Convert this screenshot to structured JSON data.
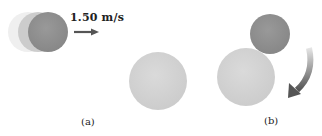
{
  "diagram": {
    "panels": [
      {
        "id": "a",
        "caption": "(a)",
        "velocity_label": "1.50 m/s",
        "description": "Small dark sphere moving right toward large light sphere at rest"
      },
      {
        "id": "b",
        "caption": "(b)",
        "description": "Small dark sphere in contact with large sphere; curved arrow indicating rotation/deflection"
      }
    ],
    "colors": {
      "small_sphere": "#8f8f8f",
      "large_sphere": "#d4d4d4",
      "ghost_1": "#eeeeee",
      "ghost_2": "#c4c4c4",
      "arrow": "#6f6f6f"
    }
  }
}
